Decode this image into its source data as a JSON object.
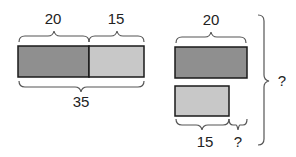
{
  "left_model": {
    "top_labels": [
      "20",
      "15"
    ],
    "bottom_label": "35",
    "segments": [
      {
        "name": "part-a",
        "value": 20,
        "color": "#8f8f8f"
      },
      {
        "name": "part-b",
        "value": 15,
        "color": "#c8c8c8"
      }
    ]
  },
  "right_model": {
    "top_label": "20",
    "bottom_labels": [
      "15",
      "?"
    ],
    "side_label": "?",
    "bars": [
      {
        "name": "bar-20",
        "value": 20,
        "color": "#8f8f8f"
      },
      {
        "name": "bar-15",
        "value": 15,
        "color": "#c8c8c8"
      }
    ]
  }
}
